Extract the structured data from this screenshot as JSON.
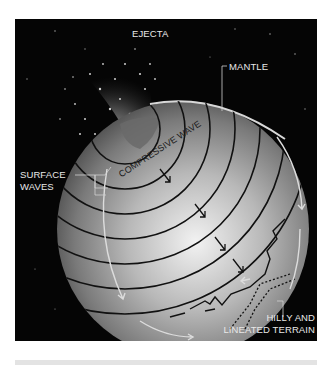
{
  "figure": {
    "labels": {
      "ejecta": "EJECTA",
      "mantle": "MANTLE",
      "surface_waves_line1": "SURFACE",
      "surface_waves_line2": "WAVES",
      "compressive_wave": "COMPRESSIVE WAVE",
      "terrain_line1": "HILLY AND",
      "terrain_line2": "LINEATED TERRAIN"
    },
    "colors": {
      "background": "#050505",
      "globe_light": "#e6e6e6",
      "globe_dark": "#4a4a4a",
      "wavefront": "#111111",
      "label_text": "#e8e8e8",
      "footer_bar": "#e3e3e3"
    }
  }
}
